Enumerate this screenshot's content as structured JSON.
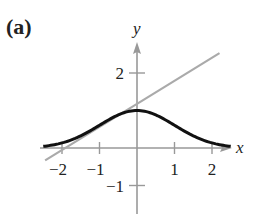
{
  "panel_label": "(a)",
  "chart_data": {
    "type": "line",
    "title": "",
    "xlabel": "x",
    "ylabel": "y",
    "xlim": [
      -2.5,
      2.6
    ],
    "ylim": [
      -1.7,
      2.6
    ],
    "x_ticks": [
      -2,
      -1,
      1,
      2
    ],
    "x_tick_labels": [
      "−2",
      "−1",
      "1",
      "2"
    ],
    "y_ticks": [
      2,
      -1
    ],
    "y_tick_labels": [
      "2",
      "−1"
    ],
    "grid": false,
    "series": [
      {
        "name": "curve",
        "color": "#111111",
        "function": "bell curve peaking at (0, 1)",
        "x": [
          -2.5,
          -2,
          -1.5,
          -1,
          -0.5,
          0,
          0.5,
          1,
          1.5,
          2,
          2.5
        ],
        "y": [
          0.04,
          0.14,
          0.32,
          0.61,
          0.88,
          1.0,
          0.88,
          0.61,
          0.32,
          0.14,
          0.04
        ]
      },
      {
        "name": "line",
        "color": "#aaaaaa",
        "x": [
          -2.45,
          2.2
        ],
        "y": [
          -0.33,
          2.53
        ]
      }
    ]
  },
  "colors": {
    "axis": "#999999",
    "curve": "#111111",
    "line": "#aaaaaa",
    "text": "#222222"
  }
}
